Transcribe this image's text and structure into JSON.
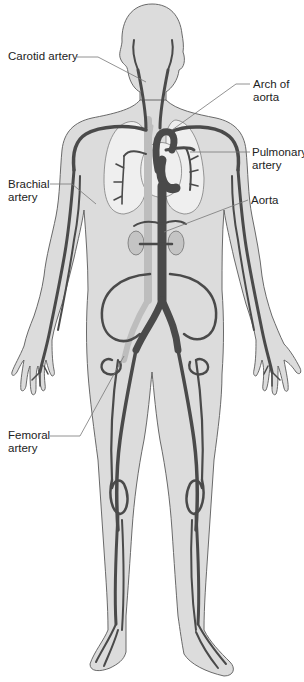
{
  "diagram": {
    "colors": {
      "background": "#ffffff",
      "body": "#dcdcdc",
      "artery": "#4a4a4a",
      "vein": "#bdbdbd",
      "outline": "#5a5a5a",
      "leader_line": "#777777",
      "label_text": "#222222"
    },
    "labels": [
      {
        "id": "carotid",
        "line1": "Carotid artery",
        "line2": ""
      },
      {
        "id": "arch",
        "line1": "Arch of",
        "line2": "aorta"
      },
      {
        "id": "pulmonary",
        "line1": "Pulmonary",
        "line2": "artery"
      },
      {
        "id": "brachial",
        "line1": "Brachial",
        "line2": "artery"
      },
      {
        "id": "aorta",
        "line1": "Aorta",
        "line2": ""
      },
      {
        "id": "femoral",
        "line1": "Femoral",
        "line2": "artery"
      }
    ]
  }
}
